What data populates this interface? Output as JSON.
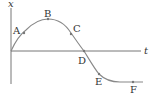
{
  "diagram": {
    "type": "position-time graph",
    "axes": {
      "vertical_label": "x",
      "horizontal_label": "t"
    },
    "points": [
      {
        "label": "A",
        "x": 24,
        "y": 33,
        "lx": 13,
        "ly": 34
      },
      {
        "label": "B",
        "x": 48,
        "y": 19,
        "lx": 44,
        "ly": 17
      },
      {
        "label": "C",
        "x": 71,
        "y": 34,
        "lx": 73,
        "ly": 32
      },
      {
        "label": "D",
        "x": 84,
        "y": 51,
        "lx": 78,
        "ly": 64
      },
      {
        "label": "E",
        "x": 99,
        "y": 74,
        "lx": 95,
        "ly": 85
      },
      {
        "label": "F",
        "x": 133,
        "y": 82,
        "lx": 130,
        "ly": 93
      }
    ],
    "colors": {
      "axis": "#666666",
      "curve": "#888888",
      "point": "#777777",
      "text": "#333333"
    }
  }
}
